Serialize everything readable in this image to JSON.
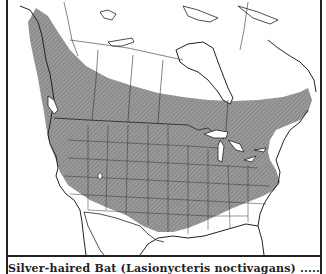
{
  "map": {
    "title": "Range map of North America",
    "legend": {
      "range_fill": "#8f8f8f",
      "outside_fill": "#ffffff",
      "border_color": "#222222"
    },
    "regions_shaded": [
      "Southern Canada",
      "Contiguous United States",
      "Northern Mexico border area"
    ],
    "regions_unshaded": [
      "Northern Canada",
      "Arctic islands",
      "Florida",
      "Gulf coast",
      "Southern California",
      "Mexico"
    ]
  },
  "caption": {
    "text": "Silver-haired Bat (Lasionycteris noctivagans) ......... 22, 26"
  }
}
